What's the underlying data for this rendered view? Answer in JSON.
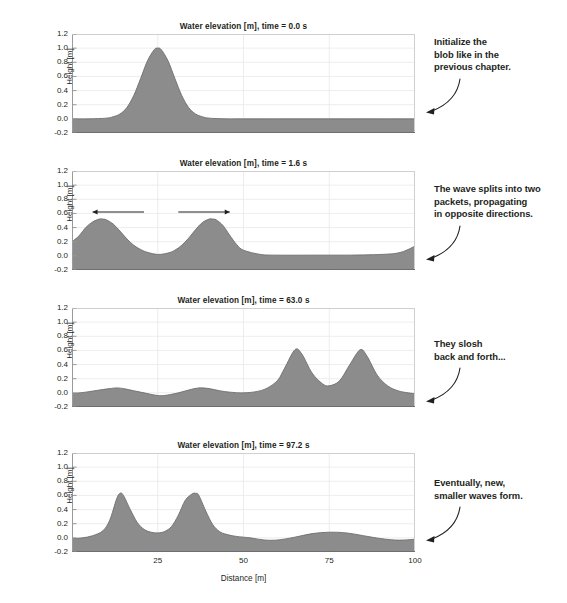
{
  "figure": {
    "xlabel": "Distance [m]",
    "ylabel": "Height [m]",
    "xticks": [
      "25",
      "50",
      "75",
      "100"
    ],
    "yticks": [
      "1.2",
      "1.0",
      "0.8",
      "0.6",
      "0.4",
      "0.2",
      "0.0",
      "-0.2"
    ],
    "fill_color": "#8c8c8c",
    "line_color": "#6e6e6e",
    "grid_color": "#e8e8e8",
    "axis_color": "#9a9a9a",
    "text_color": "#231f20"
  },
  "panels": [
    {
      "title": "Water elevation [m], time = 0.0 s",
      "annotation": "Initialize the blob like in the previous chapter.",
      "annotation_lines": [
        "Initialize the",
        "blob like in the",
        "previous chapter."
      ],
      "arrows": []
    },
    {
      "title": "Water elevation [m], time = 1.6 s",
      "annotation": "The wave splits into two packets, propagating in opposite directions.",
      "annotation_lines": [
        "The wave splits into two",
        "packets, propagating",
        "in opposite directions."
      ],
      "arrows": [
        {
          "direction": "left",
          "x_start": 21,
          "x_end": 6,
          "y": 0.62
        },
        {
          "direction": "right",
          "x_start": 31,
          "x_end": 46,
          "y": 0.62
        }
      ]
    },
    {
      "title": "Water elevation [m], time = 63.0 s",
      "annotation": "They slosh back and forth...",
      "annotation_lines": [
        "They slosh",
        "back and forth..."
      ],
      "arrows": []
    },
    {
      "title": "Water elevation [m], time = 97.2 s",
      "annotation": "Eventually, new, smaller waves form.",
      "annotation_lines": [
        "Eventually, new,",
        "smaller waves form."
      ],
      "arrows": []
    }
  ],
  "chart_data": {
    "type": "area",
    "xlabel": "Distance [m]",
    "ylabel": "Height [m]",
    "xlim": [
      0,
      100
    ],
    "ylim": [
      -0.2,
      1.2
    ],
    "xticks": [
      25,
      50,
      75,
      100
    ],
    "yticks": [
      -0.2,
      0.0,
      0.2,
      0.4,
      0.6,
      0.8,
      1.0,
      1.2
    ],
    "grid": true,
    "legend": "none",
    "series": [
      {
        "name": "time = 0.0 s",
        "description": "Single Gaussian blob centered at x = 25 with peak height 1.0, flat at 0.0 elsewhere",
        "x": [
          0,
          5,
          10,
          12,
          14,
          16,
          18,
          20,
          22,
          24,
          25,
          26,
          28,
          30,
          32,
          34,
          36,
          38,
          40,
          45,
          50,
          60,
          70,
          80,
          90,
          100
        ],
        "y": [
          0.0,
          0.0,
          0.01,
          0.03,
          0.07,
          0.16,
          0.33,
          0.57,
          0.82,
          0.98,
          1.0,
          0.98,
          0.82,
          0.57,
          0.33,
          0.16,
          0.07,
          0.03,
          0.01,
          0.0,
          0.0,
          0.0,
          0.0,
          0.0,
          0.0,
          0.0
        ]
      },
      {
        "name": "time = 1.6 s",
        "description": "Wave split into two packets of height ~0.52 at x = 9 and x = 41, moving in opposite directions",
        "x": [
          0,
          2,
          4,
          6,
          8,
          9,
          10,
          12,
          14,
          16,
          18,
          20,
          22,
          25,
          28,
          30,
          32,
          34,
          36,
          38,
          40,
          41,
          42,
          44,
          46,
          48,
          50,
          55,
          60,
          70,
          80,
          90,
          95,
          98,
          100
        ],
        "y": [
          0.2,
          0.28,
          0.4,
          0.48,
          0.52,
          0.52,
          0.51,
          0.45,
          0.35,
          0.24,
          0.15,
          0.09,
          0.05,
          0.02,
          0.04,
          0.08,
          0.15,
          0.25,
          0.37,
          0.47,
          0.52,
          0.52,
          0.51,
          0.43,
          0.29,
          0.16,
          0.08,
          0.02,
          0.01,
          0.01,
          0.01,
          0.02,
          0.04,
          0.09,
          0.14
        ]
      },
      {
        "name": "time = 63.0 s",
        "description": "Two tall peaks ~0.61 at x = 65 and x = 84, small ripples ~0.07 near x = 13 and x = 37",
        "x": [
          0,
          4,
          8,
          11,
          13,
          15,
          18,
          21,
          24,
          26,
          28,
          31,
          34,
          37,
          40,
          43,
          46,
          50,
          54,
          57,
          60,
          62,
          65,
          67,
          70,
          73,
          75,
          78,
          81,
          84,
          86,
          89,
          92,
          95,
          98,
          100
        ],
        "y": [
          -0.01,
          0.01,
          0.04,
          0.06,
          0.07,
          0.06,
          0.03,
          0.0,
          -0.03,
          -0.04,
          -0.03,
          0.0,
          0.04,
          0.07,
          0.06,
          0.03,
          0.01,
          0.0,
          0.02,
          0.07,
          0.18,
          0.35,
          0.61,
          0.55,
          0.28,
          0.13,
          0.1,
          0.17,
          0.4,
          0.61,
          0.52,
          0.25,
          0.1,
          0.03,
          0.0,
          -0.01
        ]
      },
      {
        "name": "time = 97.2 s",
        "description": "Two peaks ~0.63 at x = 14 and x = 36, and a broad low swell ~0.08 centered near x = 75",
        "x": [
          0,
          3,
          6,
          9,
          11,
          13,
          14,
          15,
          17,
          19,
          21,
          23,
          25,
          27,
          29,
          31,
          33,
          35,
          36,
          37,
          39,
          41,
          43,
          45,
          48,
          52,
          56,
          60,
          65,
          70,
          75,
          80,
          85,
          90,
          94,
          97,
          100
        ],
        "y": [
          -0.01,
          0.0,
          0.03,
          0.1,
          0.25,
          0.55,
          0.63,
          0.6,
          0.4,
          0.22,
          0.12,
          0.08,
          0.07,
          0.09,
          0.16,
          0.32,
          0.53,
          0.62,
          0.63,
          0.6,
          0.38,
          0.19,
          0.09,
          0.05,
          0.02,
          0.0,
          -0.03,
          -0.03,
          0.01,
          0.06,
          0.08,
          0.07,
          0.03,
          -0.01,
          -0.03,
          -0.03,
          -0.02
        ]
      }
    ]
  }
}
